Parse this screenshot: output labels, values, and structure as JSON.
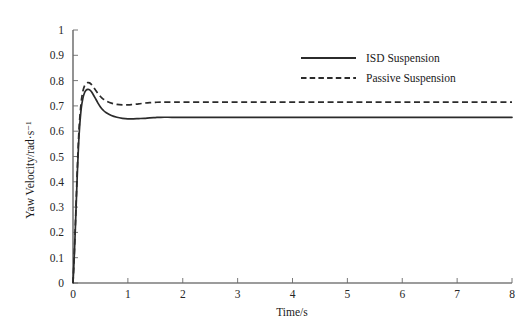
{
  "chart_data": {
    "type": "line",
    "title": "",
    "xlabel": "Time/s",
    "ylabel": "Yaw Velocity/rad·s⁻¹",
    "xlim": [
      0,
      8
    ],
    "ylim": [
      0,
      1
    ],
    "xticks": [
      0,
      1,
      2,
      3,
      4,
      5,
      6,
      7,
      8
    ],
    "xtick_labels": [
      "0",
      "1",
      "2",
      "3",
      "4",
      "5",
      "6",
      "7",
      "8"
    ],
    "yticks": [
      0,
      0.1,
      0.2,
      0.3,
      0.4,
      0.5,
      0.6,
      0.7,
      0.8,
      0.9,
      1
    ],
    "ytick_labels": [
      "0",
      "0.1",
      "0.2",
      "0.3",
      "0.4",
      "0.5",
      "0.6",
      "0.7",
      "0.8",
      "0.9",
      "1"
    ],
    "grid": false,
    "legend_position": "upper-right",
    "x": [
      0,
      0.02,
      0.04,
      0.06,
      0.08,
      0.1,
      0.12,
      0.15,
      0.18,
      0.21,
      0.24,
      0.27,
      0.3,
      0.33,
      0.36,
      0.4,
      0.45,
      0.5,
      0.55,
      0.6,
      0.7,
      0.8,
      0.9,
      1.0,
      1.1,
      1.2,
      1.3,
      1.4,
      1.5,
      1.6,
      1.8,
      2.0,
      2.5,
      3.0,
      3.5,
      4.0,
      4.5,
      5.0,
      5.5,
      6.0,
      6.5,
      7.0,
      7.5,
      8.0
    ],
    "series": [
      {
        "name": "ISD Suspension",
        "style": "solid",
        "color": "#2b2b2b",
        "peak_value": 0.765,
        "peak_time": 0.3,
        "steady_value": 0.655,
        "values": [
          0.0,
          0.09,
          0.2,
          0.32,
          0.44,
          0.54,
          0.615,
          0.69,
          0.73,
          0.752,
          0.762,
          0.765,
          0.764,
          0.758,
          0.748,
          0.733,
          0.713,
          0.696,
          0.683,
          0.674,
          0.662,
          0.655,
          0.651,
          0.649,
          0.649,
          0.65,
          0.651,
          0.653,
          0.654,
          0.655,
          0.655,
          0.655,
          0.655,
          0.655,
          0.655,
          0.655,
          0.655,
          0.655,
          0.655,
          0.655,
          0.655,
          0.655,
          0.655,
          0.655
        ]
      },
      {
        "name": "Passive Suspension",
        "style": "dashed",
        "color": "#2b2b2b",
        "peak_value": 0.792,
        "peak_time": 0.31,
        "steady_value": 0.715,
        "values": [
          0.0,
          0.095,
          0.21,
          0.335,
          0.46,
          0.565,
          0.642,
          0.717,
          0.758,
          0.779,
          0.789,
          0.792,
          0.791,
          0.786,
          0.778,
          0.766,
          0.75,
          0.737,
          0.727,
          0.72,
          0.711,
          0.706,
          0.704,
          0.704,
          0.706,
          0.708,
          0.711,
          0.713,
          0.714,
          0.715,
          0.715,
          0.715,
          0.715,
          0.715,
          0.715,
          0.715,
          0.715,
          0.715,
          0.715,
          0.715,
          0.715,
          0.715,
          0.715,
          0.715
        ]
      }
    ]
  },
  "legend": {
    "entries": [
      {
        "label": "ISD Suspension",
        "style": "solid"
      },
      {
        "label": "Passive Suspension",
        "style": "dashed"
      }
    ]
  },
  "axes": {
    "x_title": "Time/s",
    "y_title": "Yaw Velocity/rad·s⁻¹"
  }
}
